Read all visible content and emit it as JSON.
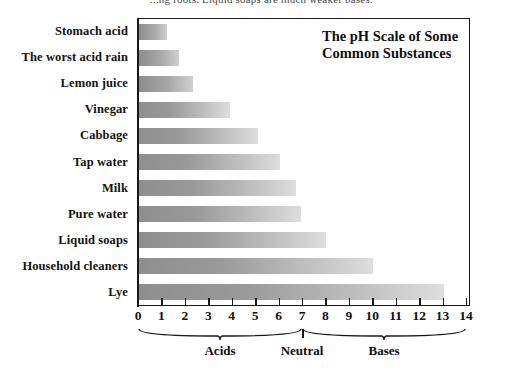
{
  "top_caption": "...ng roots. Liquid soaps are much weaker bases.",
  "chart_title_line1": "The pH Scale of Some",
  "chart_title_line2": "Common Substances",
  "axis": {
    "xmin": 0,
    "xmax": 14,
    "tick_labels": [
      "0",
      "1",
      "2",
      "3",
      "4",
      "5",
      "6",
      "7",
      "8",
      "9",
      "10",
      "11",
      "12",
      "13",
      "14"
    ]
  },
  "regions": [
    {
      "name": "acids-region",
      "label": "Acids",
      "start": 0,
      "end": 7
    },
    {
      "name": "neutral-region",
      "label": "Neutral",
      "start": 7,
      "end": 7
    },
    {
      "name": "bases-region",
      "label": "Bases",
      "start": 7,
      "end": 14
    }
  ],
  "chart_data": {
    "type": "bar",
    "orientation": "horizontal",
    "title": "The pH Scale of Some Common Substances",
    "xlabel": "pH",
    "ylabel": "",
    "xlim": [
      0,
      14
    ],
    "grid": false,
    "legend": null,
    "categories": [
      "Stomach acid",
      "The worst acid rain",
      "Lemon juice",
      "Vinegar",
      "Cabbage",
      "Tap water",
      "Milk",
      "Pure water",
      "Liquid soaps",
      "Household cleaners",
      "Lye"
    ],
    "values": [
      1.2,
      1.7,
      2.3,
      3.9,
      5.1,
      6.0,
      6.7,
      6.9,
      8.0,
      10.0,
      13.0
    ],
    "annotations": [
      {
        "label": "Acids",
        "range": [
          0,
          7
        ]
      },
      {
        "label": "Neutral",
        "range": [
          7,
          7
        ]
      },
      {
        "label": "Bases",
        "range": [
          7,
          14
        ]
      }
    ]
  },
  "colors": {
    "bar_dark": "#8e8e8e",
    "bar_light": "#dedede",
    "axis": "#1a1a1a",
    "text": "#101010",
    "background": "#ffffff"
  }
}
